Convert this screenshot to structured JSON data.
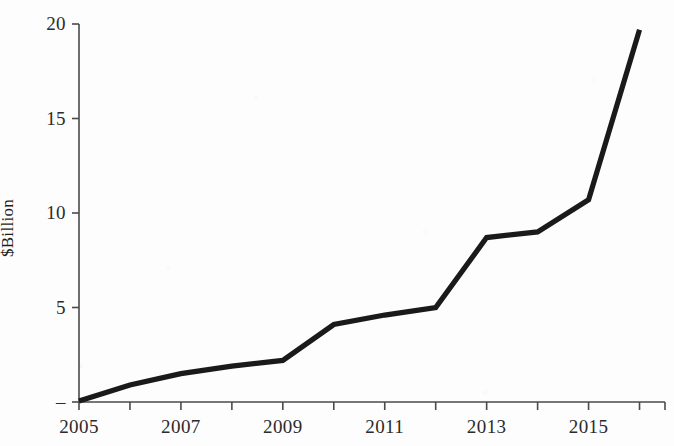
{
  "chart_data": {
    "type": "line",
    "title": "",
    "subtitle": "",
    "xlabel": "",
    "ylabel": "$Billion",
    "x": [
      2005,
      2006,
      2007,
      2008,
      2009,
      2010,
      2011,
      2012,
      2013,
      2014,
      2015,
      2016
    ],
    "values": [
      0.05,
      0.9,
      1.5,
      1.9,
      2.2,
      4.1,
      4.6,
      5.0,
      8.7,
      9.0,
      10.7,
      19.7
    ],
    "series": [
      {
        "name": "$Billion",
        "values": [
          0.05,
          0.9,
          1.5,
          1.9,
          2.2,
          4.1,
          4.6,
          5.0,
          8.7,
          9.0,
          10.7,
          19.7
        ]
      }
    ],
    "xlim": [
      2005,
      2016.5
    ],
    "ylim": [
      0,
      20
    ],
    "grid": false,
    "legend": false,
    "legend_position": "none",
    "line_color": "#1a1a1a",
    "axis_color": "#4a4a4a",
    "background_color": "#fdfdfd",
    "y_ticks": [
      0,
      5,
      10,
      15,
      20
    ],
    "y_tick_labels": [
      "–",
      "5",
      "10",
      "15",
      "20"
    ],
    "x_ticks": [
      2005,
      2006,
      2007,
      2008,
      2009,
      2010,
      2011,
      2012,
      2013,
      2014,
      2015,
      2016
    ],
    "x_tick_labels": [
      "2005",
      "",
      "2007",
      "",
      "2009",
      "",
      "2011",
      "",
      "2013",
      "",
      "2015",
      ""
    ],
    "x_labeled_ticks": [
      "2005",
      "2007",
      "2009",
      "2011",
      "2013",
      "2015"
    ],
    "annotations": []
  }
}
